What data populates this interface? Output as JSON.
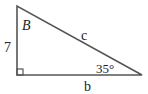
{
  "diagram": {
    "type": "right-triangle",
    "stroke_color": "#555555",
    "vertices": {
      "top": [
        17,
        6
      ],
      "right_angle": [
        17,
        75
      ],
      "right": [
        142,
        75
      ]
    },
    "labels": {
      "angle_top": "B",
      "side_left": "7",
      "hypotenuse": "c",
      "angle_right": "35°",
      "side_bottom": "b"
    }
  }
}
